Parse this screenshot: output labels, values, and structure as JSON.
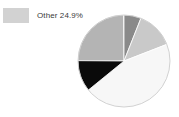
{
  "chart_data": {
    "type": "pie",
    "title": "",
    "legend_position": "top-left",
    "legend": [
      {
        "label": "Other 24.9%",
        "name": "Other",
        "value": 24.9,
        "color": "#d2d2d2"
      }
    ],
    "categories": [
      "Other",
      "Segment 2",
      "Segment 3",
      "Segment 4",
      "Segment 5"
    ],
    "values": [
      24.9,
      6.0,
      13.1,
      45.0,
      11.0
    ],
    "colors": [
      "#b4b4b4",
      "#8a8a8a",
      "#c9c9c9",
      "#f7f7f7",
      "#0a0a0a"
    ],
    "slices": [
      {
        "name": "Other",
        "value": 24.9,
        "color": "#b4b4b4",
        "start_angle": 270.0,
        "end_angle": 359.6
      },
      {
        "name": "Segment 2",
        "value": 6.0,
        "color": "#8a8a8a",
        "start_angle": 0.0,
        "end_angle": 21.6
      },
      {
        "name": "Segment 3",
        "value": 13.1,
        "color": "#c9c9c9",
        "start_angle": 21.6,
        "end_angle": 68.8
      },
      {
        "name": "Segment 4",
        "value": 45.0,
        "color": "#f7f7f7",
        "start_angle": 68.8,
        "end_angle": 230.8
      },
      {
        "name": "Segment 5",
        "value": 11.0,
        "color": "#0a0a0a",
        "start_angle": 230.8,
        "end_angle": 270.4
      }
    ],
    "geometry": {
      "cx": 124,
      "cy": 61,
      "r": 46
    },
    "stroke_color": "#ffffff",
    "background": "#ffffff",
    "xlabel": "",
    "ylabel": ""
  },
  "legend": {
    "items": [
      {
        "label": "Other 24.9%"
      }
    ]
  }
}
